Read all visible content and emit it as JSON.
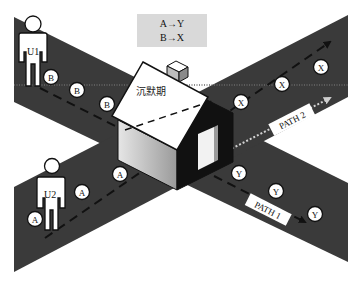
{
  "legend": {
    "lines": [
      "A→Y",
      "B→X"
    ]
  },
  "house": {
    "label": "沉默期"
  },
  "users": [
    {
      "id": "u1",
      "label": "U1"
    },
    {
      "id": "u2",
      "label": "U2"
    }
  ],
  "paths": [
    {
      "id": "path1",
      "label": "PATH 1",
      "style": "dashed"
    },
    {
      "id": "path2",
      "label": "PATH 2",
      "style": "dotted"
    }
  ],
  "packets": {
    "b": [
      "B",
      "B",
      "B"
    ],
    "x": [
      "X",
      "X",
      "X"
    ],
    "a": [
      "A",
      "A",
      "A"
    ],
    "y": [
      "Y",
      "Y",
      "Y"
    ]
  },
  "colors": {
    "road": "#3a3a3a",
    "background": "#ffffff",
    "legend_bg": "#d9d9d9",
    "house_roof": "#ffffff",
    "house_front": "#cfcfcf",
    "house_gable": "#111111"
  }
}
